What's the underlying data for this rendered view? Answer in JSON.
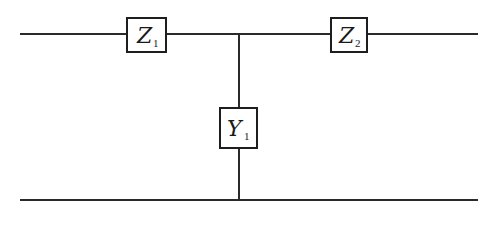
{
  "diagram": {
    "type": "two-port T-network",
    "components": [
      {
        "id": "z1",
        "symbol": "Z",
        "subscript": "1",
        "kind": "series-impedance",
        "position": "top-left"
      },
      {
        "id": "z2",
        "symbol": "Z",
        "subscript": "2",
        "kind": "series-impedance",
        "position": "top-right"
      },
      {
        "id": "y1",
        "symbol": "Y",
        "subscript": "1",
        "kind": "shunt-admittance",
        "position": "center"
      }
    ],
    "wires": [
      {
        "id": "top-rail",
        "description": "top conductor through Z1 and Z2"
      },
      {
        "id": "shunt-branch",
        "description": "vertical branch from top rail through Y1 to bottom rail"
      },
      {
        "id": "bottom-rail",
        "description": "bottom common conductor"
      }
    ],
    "colors": {
      "line": "#2a2a2a",
      "background": "#ffffff"
    }
  }
}
